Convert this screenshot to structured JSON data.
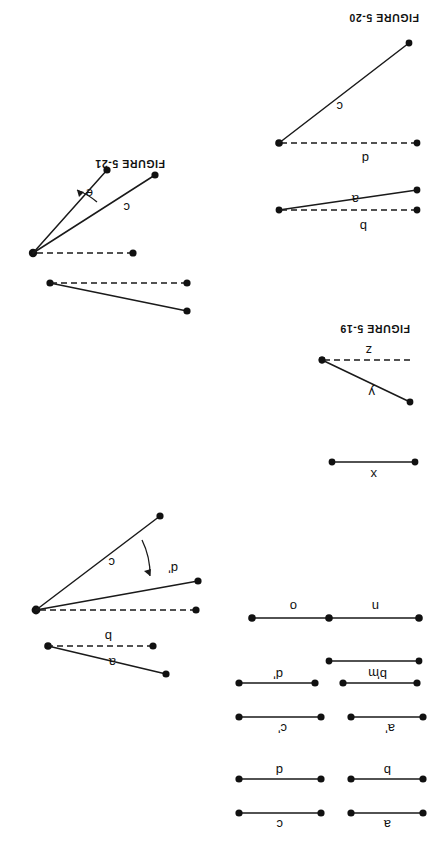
{
  "page": {
    "width": 433,
    "height": 843,
    "background": "#ffffff",
    "ink_color": "#111111",
    "orientation": "rotated-180"
  },
  "figures": [
    {
      "id": "figure-5-19",
      "title": "FIGURE 5-19",
      "labels": [
        "x",
        "y",
        "z"
      ],
      "segments": [
        {
          "name": "segment-x",
          "label": "x",
          "style": "solid"
        },
        {
          "name": "segment-y",
          "label": "y",
          "style": "solid"
        },
        {
          "name": "segment-z",
          "label": "z",
          "style": "dashed"
        }
      ]
    },
    {
      "id": "figure-5-20",
      "title": "FIGURE 5-20",
      "labels": [
        "a",
        "b",
        "c",
        "d"
      ],
      "segments": [
        {
          "name": "segment-a",
          "label": "a",
          "style": "solid"
        },
        {
          "name": "segment-b",
          "label": "b",
          "style": "dashed"
        },
        {
          "name": "segment-c",
          "label": "c",
          "style": "solid"
        },
        {
          "name": "segment-d",
          "label": "d",
          "style": "dashed"
        }
      ]
    },
    {
      "id": "figure-5-21",
      "title": "FIGURE 5-21",
      "labels": [
        "c",
        "e"
      ],
      "segments": [
        {
          "name": "ray-c",
          "label": "c",
          "style": "solid"
        },
        {
          "name": "ray-e",
          "label": "e",
          "style": "solid"
        }
      ]
    }
  ],
  "angle_figure_lower_left": {
    "id": "angle-figure-unnumbered",
    "labels": [
      "a",
      "b",
      "c",
      "d'"
    ],
    "segments": [
      {
        "name": "segment-a",
        "label": "a",
        "style": "solid"
      },
      {
        "name": "segment-b",
        "label": "b",
        "style": "dashed"
      },
      {
        "name": "ray-c",
        "label": "c",
        "style": "solid"
      },
      {
        "name": "ray-d-prime",
        "label": "d'",
        "style": "solid"
      }
    ]
  },
  "segment_group_mno": {
    "id": "segment-group-mno",
    "labels": [
      "m",
      "n",
      "o"
    ],
    "segments": [
      {
        "name": "segment-o",
        "label": "o",
        "style": "solid"
      },
      {
        "name": "segment-n",
        "label": "n",
        "style": "solid"
      },
      {
        "name": "segment-m",
        "label": "m",
        "style": "solid"
      }
    ]
  },
  "segment_group_primed": {
    "id": "segment-group-primed",
    "rows": [
      {
        "left": "d'",
        "right": "b'"
      },
      {
        "left": "c'",
        "right": "a'"
      }
    ]
  },
  "segment_group_plain": {
    "id": "segment-group-plain",
    "rows": [
      {
        "left": "d",
        "right": "b"
      },
      {
        "left": "c",
        "right": "a"
      }
    ]
  },
  "labels": {
    "a": "a",
    "b": "b",
    "c": "c",
    "d": "d",
    "e": "e",
    "m": "m",
    "n": "n",
    "o": "o",
    "x": "x",
    "y": "y",
    "z": "z",
    "a_prime": "a'",
    "b_prime": "b'",
    "c_prime": "c'",
    "d_prime": "d'"
  },
  "titles": {
    "fig19": "FIGURE 5-19",
    "fig20": "FIGURE 5-20",
    "fig21": "FIGURE 5-21"
  }
}
